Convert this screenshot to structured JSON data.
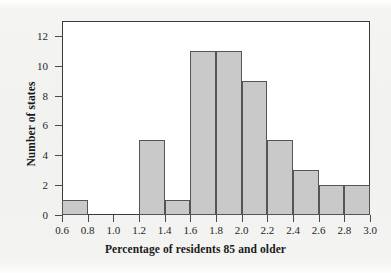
{
  "chart_data": {
    "type": "bar",
    "title": "",
    "subtitle": "",
    "xlabel": "Percentage of residents 85 and older",
    "ylabel": "Number of states",
    "xlim": [
      0.6,
      3.0
    ],
    "ylim": [
      0,
      13
    ],
    "grid": false,
    "legend": null,
    "bin_width": 0.2,
    "bin_edges": [
      0.6,
      0.8,
      1.0,
      1.2,
      1.4,
      1.6,
      1.8,
      2.0,
      2.2,
      2.4,
      2.6,
      2.8,
      3.0
    ],
    "categories": [
      "0.6-0.8",
      "0.8-1.0",
      "1.0-1.2",
      "1.2-1.4",
      "1.4-1.6",
      "1.6-1.8",
      "1.8-2.0",
      "2.0-2.2",
      "2.2-2.4",
      "2.4-2.6",
      "2.6-2.8",
      "2.8-3.0"
    ],
    "values": [
      1,
      0,
      0,
      5,
      1,
      11,
      11,
      9,
      5,
      3,
      2,
      2
    ],
    "bars": [
      {
        "left": 0.6,
        "right": 0.8,
        "value": 1
      },
      {
        "left": 0.8,
        "right": 1.0,
        "value": 0
      },
      {
        "left": 1.0,
        "right": 1.2,
        "value": 0
      },
      {
        "left": 1.2,
        "right": 1.4,
        "value": 5
      },
      {
        "left": 1.4,
        "right": 1.6,
        "value": 1
      },
      {
        "left": 1.6,
        "right": 1.8,
        "value": 11
      },
      {
        "left": 1.8,
        "right": 2.0,
        "value": 11
      },
      {
        "left": 2.0,
        "right": 2.2,
        "value": 9
      },
      {
        "left": 2.2,
        "right": 2.4,
        "value": 5
      },
      {
        "left": 2.4,
        "right": 2.6,
        "value": 3
      },
      {
        "left": 2.6,
        "right": 2.8,
        "value": 2
      },
      {
        "left": 2.8,
        "right": 3.0,
        "value": 2
      }
    ],
    "xtick_labels": [
      "0.6",
      "0.8",
      "1.0",
      "1.2",
      "1.4",
      "1.6",
      "1.8",
      "2.0",
      "2.2",
      "2.4",
      "2.6",
      "2.8",
      "3.0"
    ],
    "xtick_values": [
      0.6,
      0.8,
      1.0,
      1.2,
      1.4,
      1.6,
      1.8,
      2.0,
      2.2,
      2.4,
      2.6,
      2.8,
      3.0
    ],
    "ytick_labels": [
      "0",
      "2",
      "4",
      "6",
      "8",
      "10",
      "12"
    ],
    "ytick_values": [
      0,
      2,
      4,
      6,
      8,
      10,
      12
    ],
    "colors": {
      "bar_fill": "#c9c9c9",
      "bar_edge": "#555555",
      "axis": "#3a3a3a",
      "text": "#1a1a1a",
      "plot_background": "#ffffff",
      "figure_background": "#f2f2f0"
    }
  }
}
